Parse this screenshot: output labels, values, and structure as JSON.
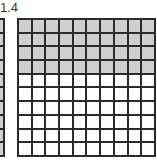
{
  "label": "1.4",
  "colors": {
    "shaded": "#cfcfcf",
    "unshaded": "#ffffff",
    "line": "#2a2a2a"
  },
  "grids": [
    {
      "name": "whole-grid",
      "rows": 10,
      "cols": 10,
      "shaded_rows": 10,
      "visible": "partial-right-edge"
    },
    {
      "name": "tenths-grid",
      "rows": 10,
      "cols": 10,
      "shaded_rows": 4
    }
  ]
}
